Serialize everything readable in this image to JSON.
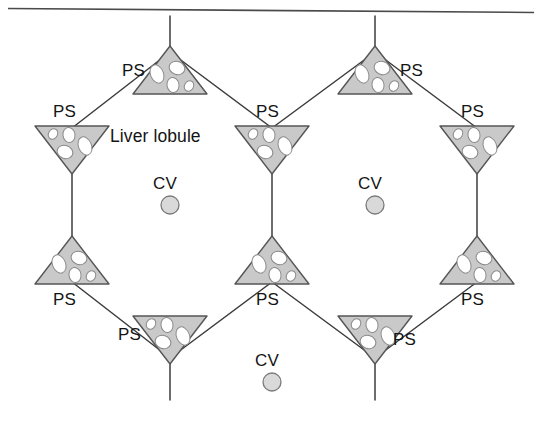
{
  "figure": {
    "type": "schematic-diagram",
    "top_rule": {
      "present": true,
      "color": "#4a4a4a"
    },
    "colors": {
      "background": "#ffffff",
      "stroke": "#3c3c3c",
      "triangle_fill": "#c9c9c9",
      "triangle_stroke": "#555555",
      "void_fill": "#ffffff",
      "vein_fill": "#d9d9d9",
      "vein_stroke": "#7a7a7a",
      "text": "#141414"
    },
    "labels": {
      "lobule": "Liver lobule",
      "portal_space": "PS",
      "central_vein": "CV"
    },
    "legend_meaning": {
      "PS": "Portal space (portal triad)",
      "CV": "Central vein"
    },
    "lobules": [
      {
        "name": "left-lobule",
        "center": [
          170,
          205
        ],
        "radius": 92,
        "vein_label": "CV",
        "area_label": "Liver lobule"
      },
      {
        "name": "right-lobule",
        "center": [
          375,
          205
        ],
        "radius": 92,
        "vein_label": "CV",
        "area_label": ""
      },
      {
        "name": "bottom-lobule",
        "center": [
          272,
          382
        ],
        "radius": 92,
        "vein_label": "CV",
        "area_label": ""
      }
    ],
    "central_veins": [
      {
        "name": "central-vein-left",
        "cx": 170,
        "cy": 205,
        "r": 9,
        "label": "CV",
        "label_pos": [
          170,
          183
        ]
      },
      {
        "name": "central-vein-right",
        "cx": 375,
        "cy": 205,
        "r": 9,
        "label": "CV",
        "label_pos": [
          375,
          183
        ]
      },
      {
        "name": "central-vein-bottom",
        "cx": 272,
        "cy": 382,
        "r": 9,
        "label": "CV",
        "label_pos": [
          272,
          360
        ]
      }
    ],
    "portal_spaces": [
      {
        "id": "ps-top-left",
        "label": "PS",
        "apex": "up",
        "at": [
          170,
          52
        ],
        "label_pos": [
          140,
          72
        ],
        "label_align": "right"
      },
      {
        "id": "ps-top-right",
        "label": "PS",
        "apex": "up",
        "at": [
          375,
          52
        ],
        "label_pos": [
          406,
          72
        ],
        "label_align": "left"
      },
      {
        "id": "ps-upper-left",
        "label": "PS",
        "apex": "down",
        "at": [
          72,
          128
        ],
        "label_pos": [
          72,
          110
        ],
        "label_align": "center"
      },
      {
        "id": "ps-upper-middle",
        "label": "PS",
        "apex": "down",
        "at": [
          272,
          128
        ],
        "label_pos": [
          272,
          110
        ],
        "label_align": "center"
      },
      {
        "id": "ps-upper-right",
        "label": "PS",
        "apex": "down",
        "at": [
          477,
          128
        ],
        "label_pos": [
          477,
          110
        ],
        "label_align": "center"
      },
      {
        "id": "ps-lower-left",
        "label": "PS",
        "apex": "up",
        "at": [
          72,
          282
        ],
        "label_pos": [
          72,
          300
        ],
        "label_align": "center"
      },
      {
        "id": "ps-lower-middle",
        "label": "PS",
        "apex": "up",
        "at": [
          272,
          282
        ],
        "label_pos": [
          272,
          300
        ],
        "label_align": "center"
      },
      {
        "id": "ps-lower-right",
        "label": "PS",
        "apex": "up",
        "at": [
          477,
          282
        ],
        "label_pos": [
          477,
          300
        ],
        "label_align": "center"
      },
      {
        "id": "ps-bottom-left",
        "label": "PS",
        "apex": "down",
        "at": [
          170,
          358
        ],
        "label_pos": [
          140,
          338
        ],
        "label_align": "right"
      },
      {
        "id": "ps-bottom-right",
        "label": "PS",
        "apex": "down",
        "at": [
          375,
          358
        ],
        "label_pos": [
          406,
          338
        ],
        "label_align": "left"
      }
    ],
    "radiating_lines": [
      {
        "name": "line-top-left-up",
        "from": [
          170,
          52
        ],
        "to": [
          170,
          14
        ]
      },
      {
        "name": "line-top-right-up",
        "from": [
          375,
          52
        ],
        "to": [
          375,
          14
        ]
      },
      {
        "name": "line-upper-left-down",
        "from": [
          72,
          128
        ],
        "to": [
          72,
          160
        ]
      },
      {
        "name": "line-upper-right-down",
        "from": [
          477,
          128
        ],
        "to": [
          477,
          160
        ]
      },
      {
        "name": "line-lower-left-up",
        "from": [
          72,
          282
        ],
        "to": [
          72,
          250
        ]
      },
      {
        "name": "line-lower-right-up",
        "from": [
          477,
          282
        ],
        "to": [
          477,
          250
        ]
      },
      {
        "name": "line-bottom-left-down",
        "from": [
          170,
          358
        ],
        "to": [
          170,
          400
        ]
      },
      {
        "name": "line-bottom-right-down",
        "from": [
          375,
          358
        ],
        "to": [
          375,
          400
        ]
      }
    ]
  }
}
